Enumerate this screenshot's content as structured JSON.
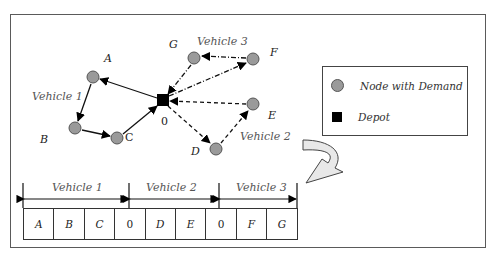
{
  "nodes": [
    {
      "id": "A",
      "label": "A",
      "x": 93,
      "y": 77
    },
    {
      "id": "B",
      "label": "B",
      "x": 75,
      "y": 128
    },
    {
      "id": "C",
      "label": "C",
      "x": 117,
      "y": 138
    },
    {
      "id": "D",
      "label": "D",
      "x": 216,
      "y": 149
    },
    {
      "id": "E",
      "label": "E",
      "x": 253,
      "y": 104
    },
    {
      "id": "F",
      "label": "F",
      "x": 253,
      "y": 59
    },
    {
      "id": "G",
      "label": "G",
      "x": 194,
      "y": 58
    }
  ],
  "depot": {
    "label": "0",
    "x": 163,
    "y": 100
  },
  "routes": [
    {
      "vehicle": "Vehicle 1",
      "path": [
        "0",
        "A",
        "B",
        "C",
        "0"
      ],
      "style": "solid"
    },
    {
      "vehicle": "Vehicle 2",
      "path": [
        "0",
        "D",
        "E",
        "0"
      ],
      "style": "dashed"
    },
    {
      "vehicle": "Vehicle 3",
      "path": [
        "0",
        "F",
        "G",
        "0"
      ],
      "style": "dash-dot"
    }
  ],
  "vehicle_labels": {
    "v1": "Vehicle 1",
    "v2": "Vehicle 2",
    "v3": "Vehicle 3"
  },
  "legend": {
    "node_with_demand": "Node with Demand",
    "depot": "Depot"
  },
  "encoding": {
    "segments": [
      "Vehicle 1",
      "Vehicle 2",
      "Vehicle 3"
    ],
    "cells": [
      "A",
      "B",
      "C",
      "0",
      "D",
      "E",
      "0",
      "F",
      "G"
    ]
  },
  "colors": {
    "node_fill": "#9a9a9a",
    "node_stroke": "#555555",
    "depot_fill": "#000000",
    "arrow_fill": "#e8e8e8"
  }
}
